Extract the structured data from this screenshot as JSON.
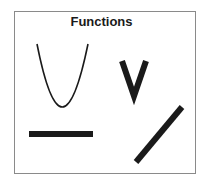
{
  "diagram": {
    "title": "Functions",
    "shapes": [
      {
        "name": "parabola",
        "type": "quadratic"
      },
      {
        "name": "v-shape",
        "type": "absolute-value"
      },
      {
        "name": "horizontal-bar",
        "type": "constant"
      },
      {
        "name": "diagonal-line",
        "type": "linear"
      }
    ],
    "colors": {
      "stroke": "#1a1a1a",
      "border": "#8a8a8a",
      "background": "#ffffff"
    }
  }
}
